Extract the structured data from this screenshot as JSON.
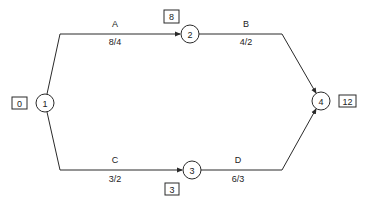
{
  "diagram": {
    "type": "activity-on-arrow network",
    "line_color": "#2a2a2a",
    "nodes": [
      {
        "id": "1",
        "label": "1",
        "time_box": "0"
      },
      {
        "id": "2",
        "label": "2",
        "time_box": "8"
      },
      {
        "id": "3",
        "label": "3",
        "time_box": "3"
      },
      {
        "id": "4",
        "label": "4",
        "time_box": "12"
      }
    ],
    "edges": [
      {
        "from": "1",
        "to": "2",
        "name": "A",
        "value": "8/4"
      },
      {
        "from": "2",
        "to": "4",
        "name": "B",
        "value": "4/2"
      },
      {
        "from": "1",
        "to": "3",
        "name": "C",
        "value": "3/2"
      },
      {
        "from": "3",
        "to": "4",
        "name": "D",
        "value": "6/3"
      }
    ]
  }
}
